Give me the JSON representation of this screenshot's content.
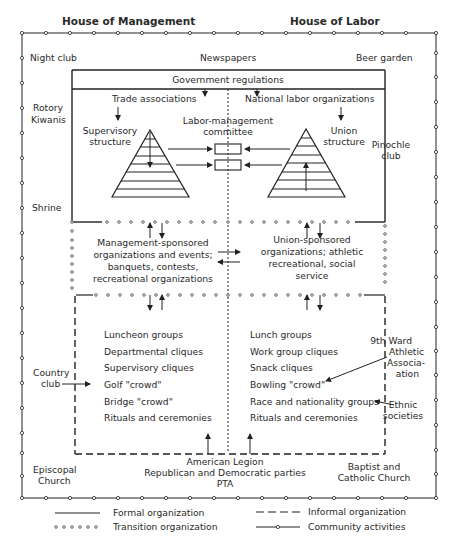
{
  "headers": {
    "left": "House of Management",
    "right": "House of Labor"
  },
  "community": {
    "top_left": "Night club",
    "top_center": "Newspapers",
    "top_right": "Beer garden",
    "left_1": [
      "Rotory",
      "Kiwanis"
    ],
    "left_2": "Shrine",
    "left_3": [
      "Country",
      "club"
    ],
    "right_1": [
      "Pinochle",
      "club"
    ],
    "right_2": [
      "9th Ward",
      "Athletic",
      "Associa-",
      "ation"
    ],
    "right_3": [
      "Ethnic",
      "societies"
    ],
    "bottom_left": [
      "Episcopal",
      "Church"
    ],
    "bottom_center": [
      "American Legion",
      "Republican and Democratic parties",
      "PTA"
    ],
    "bottom_right": [
      "Baptist and",
      "Catholic Church"
    ]
  },
  "formal": {
    "government": "Government regulations",
    "trade": "Trade associations",
    "national_labor": "National labor organizations",
    "supervisory": [
      "Supervisory",
      "structure"
    ],
    "union": [
      "Union",
      "structure"
    ],
    "committee": [
      "Labor-management",
      "committee"
    ]
  },
  "transition": {
    "management": [
      "Management-sponsored",
      "organizations and events;",
      "banquets, contests,",
      "recreational organizations"
    ],
    "union": [
      "Union-sponsored",
      "organizations; athletic",
      "recreational, social",
      "service"
    ]
  },
  "informal": {
    "management": [
      "Luncheon groups",
      "Departmental cliques",
      "Supervisory cliques",
      "Golf \"crowd\"",
      "Bridge \"crowd\"",
      "Rituals and ceremonies"
    ],
    "labor": [
      "Lunch groups",
      "Work group cliques",
      "Snack cliques",
      "Bowling \"crowd\"",
      "Race and nationality groups",
      "Rituals and ceremonies"
    ]
  },
  "legend": {
    "formal": "Formal organization",
    "informal": "Informal organization",
    "transition": "Transition organization",
    "community": "Community activities"
  }
}
